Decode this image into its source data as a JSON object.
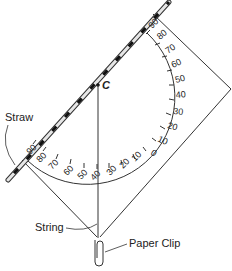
{
  "diagram": {
    "labels": {
      "straw": "Straw",
      "string": "String",
      "paper_clip": "Paper Clip",
      "center": "C"
    },
    "scale_labels_left": [
      "90",
      "80",
      "70",
      "60",
      "50",
      "40"
    ],
    "scale_labels_right": [
      "30",
      "20",
      "10",
      "0",
      "10",
      "20",
      "30",
      "40",
      "50",
      "60",
      "70",
      "80",
      "90"
    ],
    "scale": [
      "90",
      "80",
      "70",
      "60",
      "50",
      "40",
      "30",
      "20",
      "10",
      "0",
      "10",
      "20",
      "30",
      "40",
      "50",
      "60",
      "70",
      "80",
      "90"
    ],
    "colors": {
      "line": "#333333",
      "straw_stripe": "#222222",
      "straw_fill": "#dddddd"
    }
  }
}
